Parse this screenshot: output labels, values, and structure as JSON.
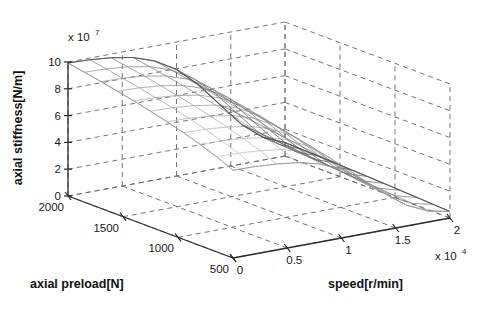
{
  "figure": {
    "background_color": "#ffffff",
    "axis_color": "#2b2b2b",
    "grid_color": "#6e6e6e",
    "mesh_color": "#555555",
    "width": 483,
    "height": 309
  },
  "chart_data": {
    "type": "surface",
    "title": "",
    "xlabel": "axial preload[N]",
    "ylabel": "speed[r/min]",
    "zlabel": "axial stiffness[N/m]",
    "x_exponent_label": "x 10",
    "x_exponent_power": "",
    "y_exponent_label": "x 10",
    "y_exponent_power": "4",
    "z_exponent_label": "x 10",
    "z_exponent_power": "7",
    "xticks": [
      2000,
      1500,
      1000,
      500
    ],
    "xticklabels": [
      "2000",
      "1500",
      "1000",
      "500"
    ],
    "yticks": [
      0,
      0.5,
      1,
      1.5,
      2
    ],
    "yticklabels": [
      "0",
      "0.5",
      "1",
      "1.5",
      "2"
    ],
    "zticks": [
      0,
      2,
      4,
      6,
      8,
      10
    ],
    "zticklabels": [
      "0",
      "2",
      "4",
      "6",
      "8",
      "10"
    ],
    "xlim": [
      500,
      2000
    ],
    "ylim": [
      0,
      2
    ],
    "zlim": [
      0,
      10
    ],
    "x_units": "N",
    "y_units": "r/min (x 10^4)",
    "z_units": "N/m (x 10^7)",
    "grid": true,
    "legend": "none",
    "x_values": [
      500,
      650,
      800,
      950,
      1100,
      1250,
      1400,
      1550,
      1700,
      1850,
      2000
    ],
    "y_values": [
      0,
      0.2,
      0.4,
      0.6,
      0.8,
      1.0,
      1.2,
      1.4,
      1.6,
      1.8,
      2.0
    ],
    "z_matrix": [
      [
        6.55,
        6.52,
        6.42,
        6.22,
        5.82,
        5.12,
        4.05,
        2.72,
        1.55,
        0.82,
        0.48
      ],
      [
        7.1,
        7.06,
        6.95,
        6.73,
        6.3,
        5.56,
        4.42,
        3.0,
        1.74,
        0.93,
        0.55
      ],
      [
        7.56,
        7.52,
        7.4,
        7.17,
        6.71,
        5.93,
        4.74,
        3.25,
        1.91,
        1.03,
        0.61
      ],
      [
        7.96,
        7.92,
        7.79,
        7.55,
        7.07,
        6.26,
        5.03,
        3.48,
        2.07,
        1.13,
        0.67
      ],
      [
        8.32,
        8.28,
        8.14,
        7.89,
        7.39,
        6.56,
        5.29,
        3.69,
        2.22,
        1.22,
        0.73
      ],
      [
        8.64,
        8.6,
        8.46,
        8.2,
        7.69,
        6.83,
        5.53,
        3.89,
        2.36,
        1.31,
        0.78
      ],
      [
        8.94,
        8.89,
        8.75,
        8.48,
        7.96,
        7.08,
        5.76,
        4.08,
        2.49,
        1.39,
        0.83
      ],
      [
        9.21,
        9.16,
        9.02,
        8.75,
        8.21,
        7.32,
        5.97,
        4.25,
        2.61,
        1.47,
        0.88
      ],
      [
        9.46,
        9.41,
        9.27,
        8.99,
        8.45,
        7.54,
        6.17,
        4.42,
        2.73,
        1.54,
        0.93
      ],
      [
        9.7,
        9.65,
        9.5,
        9.22,
        8.67,
        7.75,
        6.36,
        4.58,
        2.84,
        1.61,
        0.97
      ],
      [
        9.92,
        9.87,
        9.72,
        9.44,
        8.88,
        7.95,
        6.53,
        4.73,
        2.95,
        1.68,
        1.01
      ]
    ],
    "z_matrix_note": "rows = axial preload (x_values ascending), cols = speed (y_values ascending), units 10^7 N/m",
    "annotations": [],
    "view": {
      "azimuth": -37.5,
      "elevation": 30
    }
  }
}
